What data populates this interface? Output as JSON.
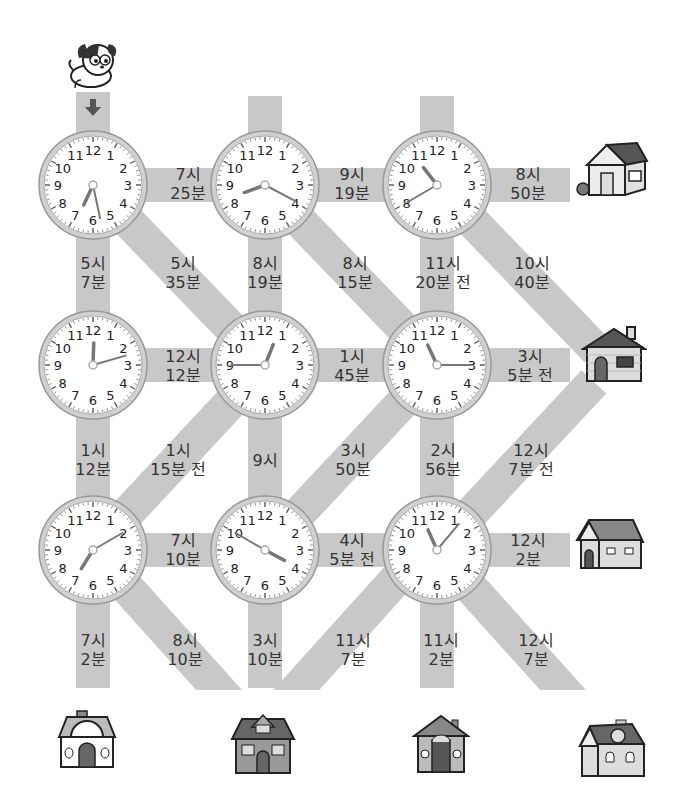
{
  "puzzle": {
    "start": "dog",
    "start_arrow": "down"
  },
  "clocks": [
    {
      "row": 1,
      "col": 1,
      "x": 93,
      "y": 185,
      "hour_deg": 205,
      "minute_deg": 168
    },
    {
      "row": 1,
      "col": 2,
      "x": 265,
      "y": 185,
      "hour_deg": 250,
      "minute_deg": 118
    },
    {
      "row": 1,
      "col": 3,
      "x": 437,
      "y": 185,
      "hour_deg": 322,
      "minute_deg": 240
    },
    {
      "row": 2,
      "col": 1,
      "x": 93,
      "y": 365,
      "hour_deg": 2,
      "minute_deg": 74
    },
    {
      "row": 2,
      "col": 2,
      "x": 265,
      "y": 365,
      "hour_deg": 22,
      "minute_deg": 270
    },
    {
      "row": 2,
      "col": 3,
      "x": 437,
      "y": 365,
      "hour_deg": 335,
      "minute_deg": 90
    },
    {
      "row": 3,
      "col": 1,
      "x": 93,
      "y": 550,
      "hour_deg": 212,
      "minute_deg": 60
    },
    {
      "row": 3,
      "col": 2,
      "x": 265,
      "y": 550,
      "hour_deg": 118,
      "minute_deg": 300
    },
    {
      "row": 3,
      "col": 3,
      "x": 437,
      "y": 550,
      "hour_deg": 336,
      "minute_deg": 40
    }
  ],
  "clock_numbers": [
    "12",
    "1",
    "2",
    "3",
    "4",
    "5",
    "6",
    "7",
    "8",
    "9",
    "10",
    "11"
  ],
  "paths": {
    "r1_h1": {
      "line1": "7시",
      "line2": "25분"
    },
    "r1_h2": {
      "line1": "9시",
      "line2": "19분"
    },
    "r1_h3": {
      "line1": "8시",
      "line2": "50분"
    },
    "v1_c1": {
      "line1": "5시",
      "line2": "7분"
    },
    "d1_c1": {
      "line1": "5시",
      "line2": "35분"
    },
    "v1_c2": {
      "line1": "8시",
      "line2": "19분"
    },
    "d1_c2": {
      "line1": "8시",
      "line2": "15분"
    },
    "v1_c3": {
      "line1": "11시",
      "line2": "20분 전"
    },
    "d1_c3": {
      "line1": "10시",
      "line2": "40분"
    },
    "r2_h1": {
      "line1": "12시",
      "line2": "12분"
    },
    "r2_h2": {
      "line1": "1시",
      "line2": "45분"
    },
    "r2_h3": {
      "line1": "3시",
      "line2": "5분 전"
    },
    "v2_c1": {
      "line1": "1시",
      "line2": "12분"
    },
    "d2_c1": {
      "line1": "1시",
      "line2": "15분 전"
    },
    "v2_c2": {
      "line1": "9시",
      "line2": ""
    },
    "d2_c2": {
      "line1": "3시",
      "line2": "50분"
    },
    "v2_c3": {
      "line1": "2시",
      "line2": "56분"
    },
    "d2_c3": {
      "line1": "12시",
      "line2": "7분 전"
    },
    "r3_h1": {
      "line1": "7시",
      "line2": "10분"
    },
    "r3_h2": {
      "line1": "4시",
      "line2": "5분 전"
    },
    "r3_h3": {
      "line1": "12시",
      "line2": "2분"
    },
    "v3_c1": {
      "line1": "7시",
      "line2": "2분"
    },
    "d3_c1": {
      "line1": "8시",
      "line2": "10분"
    },
    "v3_c2": {
      "line1": "3시",
      "line2": "10분"
    },
    "d3_c2": {
      "line1": "11시",
      "line2": "7분"
    },
    "v3_c3": {
      "line1": "11시",
      "line2": "2분"
    },
    "d3_c3": {
      "line1": "12시",
      "line2": "7분"
    }
  },
  "houses": [
    {
      "id": "house-right-1",
      "x": 612,
      "y": 170
    },
    {
      "id": "house-right-2",
      "x": 614,
      "y": 355
    },
    {
      "id": "house-right-3",
      "x": 610,
      "y": 545
    },
    {
      "id": "house-bottom-1",
      "x": 87,
      "y": 742
    },
    {
      "id": "house-bottom-2",
      "x": 263,
      "y": 745
    },
    {
      "id": "house-bottom-3",
      "x": 441,
      "y": 745
    },
    {
      "id": "house-bottom-4",
      "x": 612,
      "y": 750
    }
  ],
  "colors": {
    "band": "#c8c8c8",
    "clock_rim": "#a9a9a9",
    "hand": "#777777",
    "text": "#333333"
  }
}
